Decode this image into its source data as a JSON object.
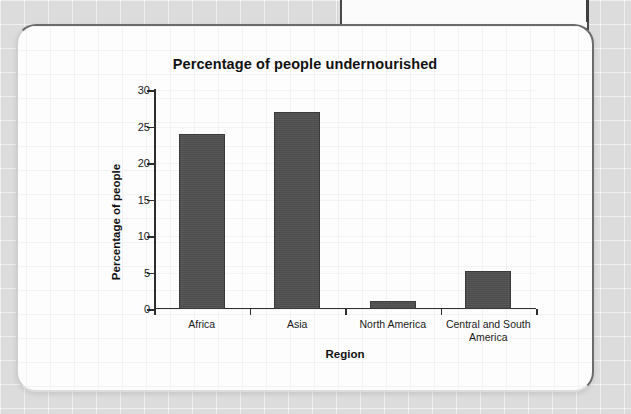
{
  "chart_data": {
    "type": "bar",
    "title": "Percentage of people undernourished",
    "xlabel": "Region",
    "ylabel": "Percentage of people",
    "categories": [
      "Africa",
      "Asia",
      "North America",
      "Central and South America"
    ],
    "values": [
      24,
      27,
      1.1,
      5.2
    ],
    "ylim": [
      0,
      30
    ],
    "ytick_labels": [
      "0",
      "5",
      "10",
      "15",
      "20",
      "25",
      "30"
    ],
    "ytick_values": [
      0,
      5,
      10,
      15,
      20,
      25,
      30
    ],
    "grid": true,
    "legend": false,
    "bar_color": "#4d4d4d",
    "axis_color": "#2e2e2e"
  },
  "card": {
    "background": "#fdfdfd",
    "border_color": "#6b6b6b"
  },
  "page": {
    "background": "#dcdcdc"
  }
}
